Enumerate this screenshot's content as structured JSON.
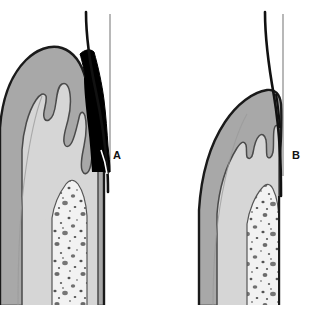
{
  "figure": {
    "type": "medical-illustration",
    "domain": "dental-histology",
    "background_color": "#ffffff",
    "width": 311,
    "height": 313,
    "panels": [
      {
        "id": "A",
        "label": "A",
        "label_x": 113,
        "label_y": 150,
        "condition": "diseased periodontium with deep periodontal pocket",
        "features": [
          "periodontal pocket (black void between tooth surface and gingiva)",
          "inflamed gingival connective tissue",
          "elongated irregular rete pegs at epithelial interface",
          "apically migrated junctional epithelium",
          "dental pulp with stippled cellular texture",
          "enamel surface line"
        ]
      },
      {
        "id": "B",
        "label": "B",
        "label_x": 292,
        "label_y": 150,
        "condition": "healthy periodontium without pocket",
        "features": [
          "no periodontal pocket",
          "smooth shallow gingival sulcus",
          "regular epithelial interface with shallow rete pegs",
          "coronally positioned gingival margin",
          "dental pulp with stippled cellular texture",
          "enamel surface line"
        ]
      }
    ],
    "colors": {
      "background": "#ffffff",
      "gingiva_outer": "#a8a8a8",
      "gingiva_inner": "#c9c9c9",
      "dentin": "#d6d6d6",
      "pulp": "#f2f2f2",
      "pulp_stipple": "#4a4a4a",
      "pocket_void": "#000000",
      "outline": "#1a1a1a",
      "enamel_line_thin": "#9a9a9a",
      "label_text": "#111111"
    },
    "tissue_legend": [
      {
        "name": "periodontal-pocket",
        "color": "#000000"
      },
      {
        "name": "gingival-connective-tissue",
        "color": "#a8a8a8"
      },
      {
        "name": "gingival-epithelium",
        "color": "#c9c9c9"
      },
      {
        "name": "dentin",
        "color": "#d6d6d6"
      },
      {
        "name": "dental-pulp",
        "color": "#f2f2f2"
      }
    ]
  }
}
